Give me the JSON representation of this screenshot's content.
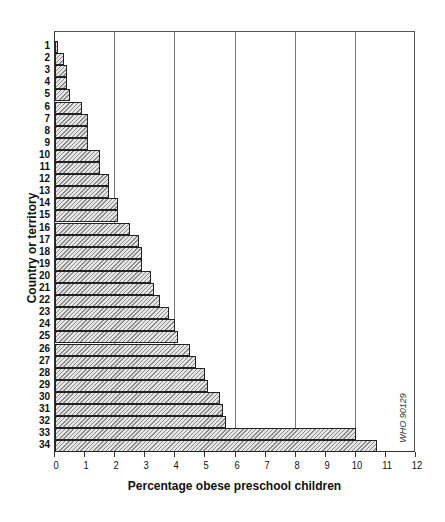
{
  "chart_data": {
    "type": "bar",
    "orientation": "horizontal",
    "title": "",
    "xlabel": "Percentage obese preschool children",
    "ylabel": "Country or territory",
    "xlim": [
      0,
      12
    ],
    "x_ticks": [
      0,
      1,
      2,
      3,
      4,
      5,
      6,
      7,
      8,
      9,
      10,
      11,
      12
    ],
    "gridlines_x": [
      2,
      4,
      6,
      8,
      10
    ],
    "grid": true,
    "legend": null,
    "categories": [
      "1",
      "2",
      "3",
      "4",
      "5",
      "6",
      "7",
      "8",
      "9",
      "10",
      "11",
      "12",
      "13",
      "14",
      "15",
      "16",
      "17",
      "18",
      "19",
      "20",
      "21",
      "22",
      "23",
      "24",
      "25",
      "26",
      "27",
      "28",
      "29",
      "30",
      "31",
      "32",
      "33",
      "34"
    ],
    "values": [
      0.1,
      0.3,
      0.4,
      0.4,
      0.5,
      0.9,
      1.1,
      1.1,
      1.1,
      1.5,
      1.5,
      1.8,
      1.8,
      2.1,
      2.1,
      2.5,
      2.8,
      2.9,
      2.9,
      3.2,
      3.3,
      3.5,
      3.8,
      4.0,
      4.1,
      4.5,
      4.7,
      5.0,
      5.1,
      5.5,
      5.6,
      5.7,
      10.0,
      10.7
    ],
    "annotations": [
      "WHO 90129"
    ]
  },
  "labels": {
    "xlabel": "Percentage obese preschool children",
    "ylabel": "Country or territory",
    "watermark": "WHO 90129"
  },
  "style": {
    "bar_fill": "#bdbdbd",
    "bar_border": "#222222",
    "grid_color": "#777777"
  }
}
